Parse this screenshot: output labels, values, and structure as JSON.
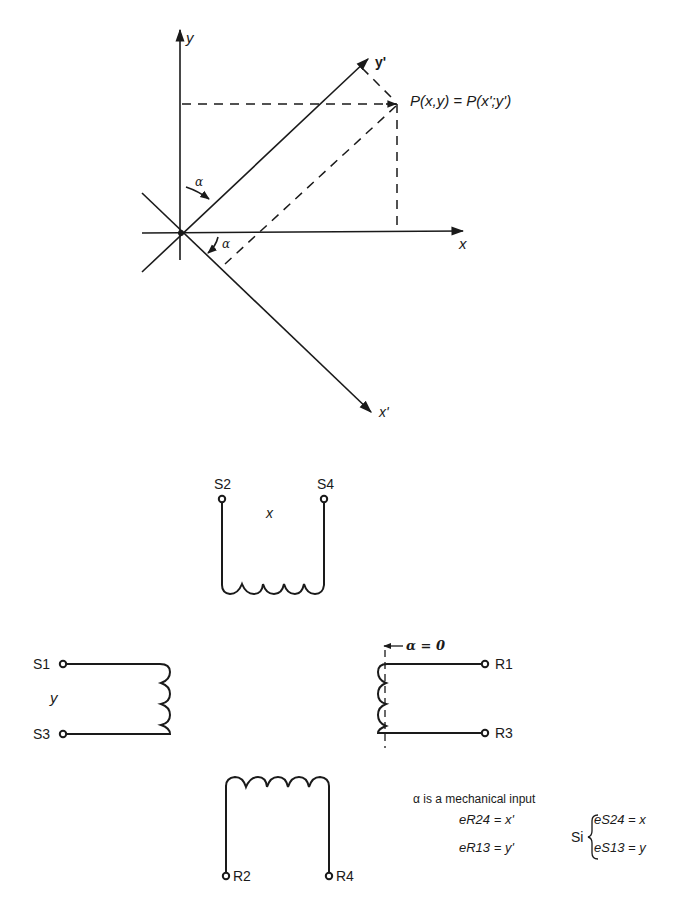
{
  "coordinate_diagram": {
    "axes": {
      "x_label": "x",
      "y_label": "y",
      "x_prime_label": "x'",
      "y_prime_label": "y'"
    },
    "angle_label_upper": "α",
    "angle_label_lower": "α",
    "point_label": "P(x,y) = P(x';y')"
  },
  "resolver_diagram": {
    "stator_x_winding": {
      "terminal_left": "S2",
      "terminal_right": "S4",
      "label": "x"
    },
    "stator_y_winding": {
      "terminal_top": "S1",
      "terminal_bottom": "S3",
      "label": "y"
    },
    "rotor_winding_13": {
      "terminal_top": "R1",
      "terminal_bottom": "R3",
      "angle_note": "α = 0"
    },
    "rotor_winding_24": {
      "terminal_left": "R2",
      "terminal_right": "R4"
    },
    "notes": {
      "mechanical_input": "α is a mechanical input",
      "rotor_eq_1": "eR24 = x'",
      "rotor_eq_2": "eR13 = y'",
      "si_prefix": "Si",
      "stator_eq_1": "eS24 = x",
      "stator_eq_2": "eS13 = y"
    }
  }
}
